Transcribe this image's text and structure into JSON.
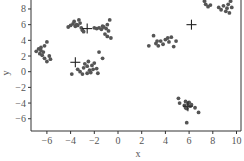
{
  "chart_data": {
    "type": "scatter",
    "title": "",
    "xlabel": "x",
    "ylabel": "y",
    "xlim": [
      -7,
      10.3
    ],
    "ylim": [
      -7.6,
      9.2
    ],
    "xticks": [
      -6,
      -4,
      -2,
      0,
      2,
      4,
      6,
      8,
      10
    ],
    "yticks": [
      8,
      6,
      4,
      2,
      0,
      -2,
      -4,
      -6
    ],
    "grid": false,
    "legend": null,
    "point_color": "#555555",
    "marker_color": "#222222",
    "series": [
      {
        "name": "points",
        "marker": "circle",
        "points": [
          [
            -4.2,
            5.7
          ],
          [
            -4.0,
            5.9
          ],
          [
            -3.8,
            6.1
          ],
          [
            -3.7,
            6.4
          ],
          [
            -3.6,
            5.8
          ],
          [
            -3.5,
            6.0
          ],
          [
            -3.3,
            6.6
          ],
          [
            -3.2,
            6.2
          ],
          [
            -3.1,
            5.6
          ],
          [
            -3.0,
            5.3
          ],
          [
            -2.9,
            5.1
          ],
          [
            -3.4,
            5.9
          ],
          [
            -2.0,
            5.6
          ],
          [
            -1.8,
            5.5
          ],
          [
            -1.6,
            5.6
          ],
          [
            -1.4,
            5.4
          ],
          [
            -1.2,
            5.7
          ],
          [
            -1.0,
            5.5
          ],
          [
            -0.9,
            6.0
          ],
          [
            -0.8,
            5.2
          ],
          [
            -0.7,
            6.6
          ],
          [
            -1.1,
            4.8
          ],
          [
            -0.9,
            4.5
          ],
          [
            -0.6,
            4.3
          ],
          [
            -1.3,
            5.8
          ],
          [
            -6.9,
            2.6
          ],
          [
            -6.7,
            2.9
          ],
          [
            -6.6,
            2.3
          ],
          [
            -6.5,
            2.7
          ],
          [
            -6.4,
            2.1
          ],
          [
            -6.3,
            2.5
          ],
          [
            -6.2,
            3.3
          ],
          [
            -6.0,
            3.8
          ],
          [
            -6.2,
            1.7
          ],
          [
            -6.0,
            1.3
          ],
          [
            -5.8,
            2.0
          ],
          [
            -5.7,
            1.6
          ],
          [
            -6.5,
            3.1
          ],
          [
            -3.9,
            -0.3
          ],
          [
            -3.4,
            0.3
          ],
          [
            -3.2,
            0.0
          ],
          [
            -3.0,
            -0.3
          ],
          [
            -2.9,
            0.5
          ],
          [
            -2.8,
            1.0
          ],
          [
            -2.6,
            0.7
          ],
          [
            -2.5,
            1.3
          ],
          [
            -2.4,
            0.2
          ],
          [
            -2.3,
            -0.1
          ],
          [
            -2.2,
            0.8
          ],
          [
            -2.0,
            1.1
          ],
          [
            -1.8,
            0.4
          ],
          [
            -1.7,
            -0.2
          ],
          [
            -1.6,
            2.5
          ],
          [
            -1.3,
            1.7
          ],
          [
            -2.6,
            -0.2
          ],
          [
            -2.1,
            0.3
          ],
          [
            2.6,
            3.3
          ],
          [
            3.0,
            4.6
          ],
          [
            3.2,
            3.6
          ],
          [
            3.4,
            3.3
          ],
          [
            3.6,
            3.9
          ],
          [
            3.8,
            3.5
          ],
          [
            4.0,
            4.1
          ],
          [
            4.2,
            4.3
          ],
          [
            4.3,
            3.8
          ],
          [
            4.5,
            4.4
          ],
          [
            4.7,
            3.2
          ],
          [
            4.9,
            3.9
          ],
          [
            3.3,
            3.9
          ],
          [
            7.3,
            9.0
          ],
          [
            7.4,
            8.6
          ],
          [
            7.6,
            8.3
          ],
          [
            7.8,
            8.5
          ],
          [
            8.5,
            8.2
          ],
          [
            8.7,
            7.9
          ],
          [
            8.9,
            8.4
          ],
          [
            9.1,
            7.7
          ],
          [
            9.2,
            8.1
          ],
          [
            9.3,
            8.6
          ],
          [
            9.4,
            7.5
          ],
          [
            9.5,
            9.0
          ],
          [
            9.6,
            8.2
          ],
          [
            5.1,
            -3.4
          ],
          [
            5.2,
            -4.0
          ],
          [
            5.6,
            -4.3
          ],
          [
            5.7,
            -3.8
          ],
          [
            5.8,
            -4.7
          ],
          [
            5.9,
            -4.1
          ],
          [
            6.0,
            -3.9
          ],
          [
            6.1,
            -4.4
          ],
          [
            6.2,
            -4.2
          ],
          [
            6.5,
            -4.6
          ],
          [
            6.8,
            -5.2
          ],
          [
            5.8,
            -6.5
          ],
          [
            5.7,
            -4.6
          ]
        ]
      },
      {
        "name": "centroids",
        "marker": "plus",
        "points": [
          [
            -2.6,
            5.5
          ],
          [
            -3.6,
            1.2
          ],
          [
            6.2,
            6.0
          ],
          [
            5.9,
            -4.4
          ]
        ]
      }
    ]
  },
  "plot": {
    "left": 31,
    "right": 241,
    "top": -2,
    "bottom": 131,
    "x0_px": 118,
    "x_scale": 11.85,
    "y0_px": 71.7,
    "y_scale": 7.84
  }
}
